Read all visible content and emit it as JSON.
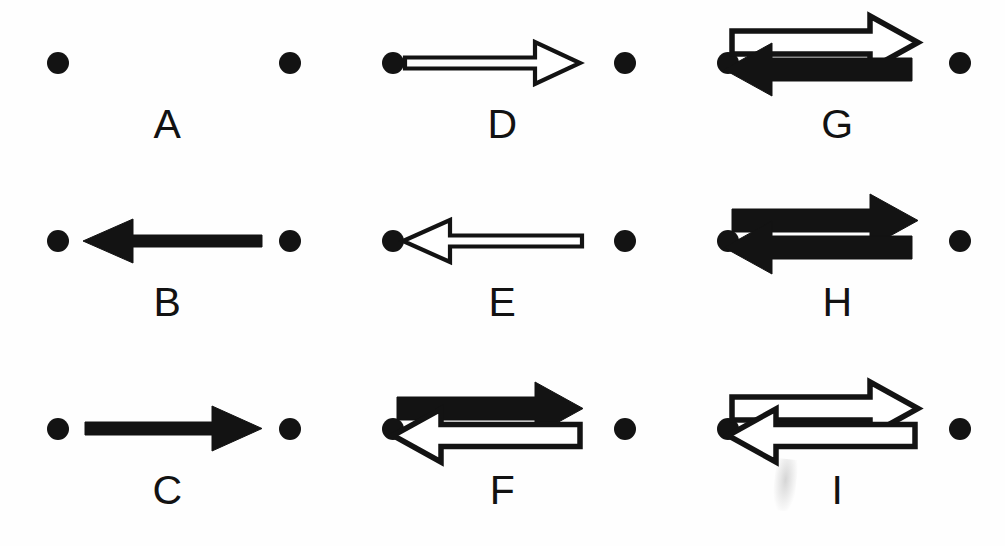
{
  "figure": {
    "background_color": "#fefefe",
    "ink_color": "#131313",
    "columns": 3,
    "rows": 3,
    "width": 1005,
    "height": 546
  },
  "panels": [
    {
      "id": "A",
      "label": "A",
      "row": 1,
      "column": 1,
      "dots": [
        "left",
        "right"
      ],
      "arrows": []
    },
    {
      "id": "D",
      "label": "D",
      "row": 1,
      "column": 2,
      "dots": [
        "left",
        "right"
      ],
      "arrows": [
        {
          "direction": "right",
          "fill": "hollow",
          "weight": "thin",
          "position": "single"
        }
      ]
    },
    {
      "id": "G",
      "label": "G",
      "row": 1,
      "column": 3,
      "dots": [
        "left",
        "right"
      ],
      "arrows": [
        {
          "direction": "right",
          "fill": "hollow",
          "weight": "thick",
          "position": "top"
        },
        {
          "direction": "left",
          "fill": "solid",
          "weight": "thick",
          "position": "bottom"
        }
      ]
    },
    {
      "id": "B",
      "label": "B",
      "row": 2,
      "column": 1,
      "dots": [
        "left",
        "right"
      ],
      "arrows": [
        {
          "direction": "left",
          "fill": "solid",
          "weight": "thin",
          "position": "single"
        }
      ]
    },
    {
      "id": "E",
      "label": "E",
      "row": 2,
      "column": 2,
      "dots": [
        "left",
        "right"
      ],
      "arrows": [
        {
          "direction": "left",
          "fill": "hollow",
          "weight": "thin",
          "position": "single"
        }
      ]
    },
    {
      "id": "H",
      "label": "H",
      "row": 2,
      "column": 3,
      "dots": [
        "left",
        "right"
      ],
      "arrows": [
        {
          "direction": "right",
          "fill": "solid",
          "weight": "thick",
          "position": "top"
        },
        {
          "direction": "left",
          "fill": "solid",
          "weight": "thick",
          "position": "bottom"
        }
      ]
    },
    {
      "id": "C",
      "label": "C",
      "row": 3,
      "column": 1,
      "dots": [
        "left",
        "right"
      ],
      "arrows": [
        {
          "direction": "right",
          "fill": "solid",
          "weight": "thin",
          "position": "single"
        }
      ]
    },
    {
      "id": "F",
      "label": "F",
      "row": 3,
      "column": 2,
      "dots": [
        "left",
        "right"
      ],
      "arrows": [
        {
          "direction": "right",
          "fill": "solid",
          "weight": "thick",
          "position": "top"
        },
        {
          "direction": "left",
          "fill": "hollow",
          "weight": "thick",
          "position": "bottom"
        }
      ]
    },
    {
      "id": "I",
      "label": "I",
      "row": 3,
      "column": 3,
      "dots": [
        "left",
        "right"
      ],
      "arrows": [
        {
          "direction": "right",
          "fill": "hollow",
          "weight": "thick",
          "position": "top"
        },
        {
          "direction": "left",
          "fill": "hollow",
          "weight": "thick",
          "position": "bottom"
        }
      ],
      "artifact": "faint-smudge"
    }
  ]
}
